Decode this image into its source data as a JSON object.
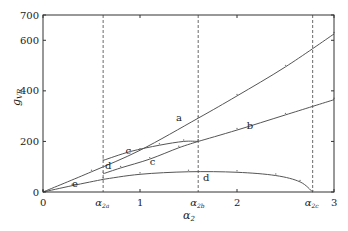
{
  "chart_data": {
    "type": "line",
    "title": "",
    "xlabel": "α2",
    "ylabel": "g_VR",
    "xlim": [
      0,
      3
    ],
    "ylim": [
      0,
      700
    ],
    "xticks": [
      0,
      1,
      2,
      3
    ],
    "yticks": [
      0,
      200,
      400,
      600,
      700
    ],
    "grid": false,
    "vlines": [
      {
        "name": "α2a",
        "x": 0.62
      },
      {
        "name": "α2b",
        "x": 1.6
      },
      {
        "name": "α2c",
        "x": 2.78
      }
    ],
    "series": [
      {
        "name": "a",
        "x": [
          0,
          0.5,
          1.0,
          1.6,
          2.0,
          2.5,
          3.0
        ],
        "y": [
          0,
          80,
          165,
          292,
          380,
          495,
          625
        ]
      },
      {
        "name": "b",
        "x": [
          1.6,
          2.0,
          2.5,
          3.0
        ],
        "y": [
          200,
          245,
          305,
          365
        ]
      },
      {
        "name": "c_upper",
        "x": [
          0.62,
          0.9,
          1.2,
          1.45,
          1.6
        ],
        "y": [
          125,
          160,
          185,
          200,
          200
        ]
      },
      {
        "name": "c_lower",
        "x": [
          1.6,
          1.4,
          1.1,
          0.8,
          0.62
        ],
        "y": [
          200,
          175,
          130,
          95,
          72
        ]
      },
      {
        "name": "d",
        "x": [
          0.62,
          1.0,
          1.5,
          2.0,
          2.4,
          2.65,
          2.78
        ],
        "y": [
          50,
          70,
          80,
          78,
          65,
          40,
          0
        ]
      },
      {
        "name": "e",
        "x": [
          0,
          0.3,
          0.62
        ],
        "y": [
          0,
          25,
          50
        ]
      }
    ],
    "curve_labels": [
      {
        "text": "a",
        "x": 1.37,
        "y": 280
      },
      {
        "text": "b",
        "x": 2.1,
        "y": 250
      },
      {
        "text": "c",
        "x": 0.85,
        "y": 150
      },
      {
        "text": "c",
        "x": 1.1,
        "y": 105
      },
      {
        "text": "d",
        "x": 0.64,
        "y": 90
      },
      {
        "text": "d",
        "x": 1.65,
        "y": 45
      },
      {
        "text": "e",
        "x": 0.3,
        "y": 20
      }
    ]
  },
  "axes": {
    "y_label": "g",
    "y_label_sub": "VR",
    "x_label": "α",
    "x_label_sub": "2",
    "x_tick_labels": [
      "0",
      "1",
      "2",
      "3"
    ],
    "y_tick_labels": [
      "0",
      "200",
      "400",
      "600",
      "700"
    ],
    "vline_labels": [
      {
        "base": "α",
        "sub": "2a"
      },
      {
        "base": "α",
        "sub": "2b"
      },
      {
        "base": "α",
        "sub": "2c"
      }
    ]
  }
}
